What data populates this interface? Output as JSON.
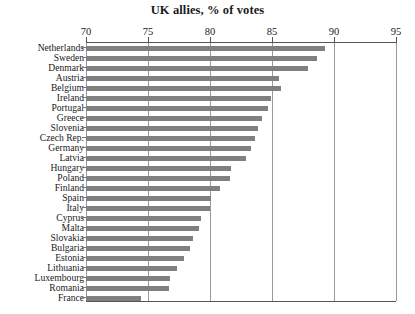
{
  "chart_data": {
    "type": "bar",
    "orientation": "horizontal",
    "title": "UK allies, % of votes",
    "xlabel": "",
    "ylabel": "",
    "xlim": [
      70,
      95
    ],
    "xticks": [
      70,
      75,
      80,
      85,
      90,
      95
    ],
    "xtick_labels": [
      "70",
      "75",
      "80",
      "85",
      "90",
      "95"
    ],
    "grid": true,
    "legend": "none",
    "bar_color": "#808080",
    "categories": [
      "Netherlands",
      "Sweden",
      "Denmark",
      "Austria",
      "Belgium",
      "Ireland",
      "Portugal",
      "Greece",
      "Slovenia",
      "Czech Rep.",
      "Germany",
      "Latvia",
      "Hungary",
      "Poland",
      "Finland",
      "Spain",
      "Italy",
      "Cyprus",
      "Malta",
      "Slovakia",
      "Bulgaria",
      "Estonia",
      "Lithuania",
      "Luxembourg",
      "Romania",
      "France"
    ],
    "values": [
      89.3,
      88.6,
      87.9,
      85.6,
      85.7,
      84.9,
      84.7,
      84.2,
      83.9,
      83.6,
      83.3,
      82.9,
      81.7,
      81.6,
      80.8,
      80.1,
      80.0,
      79.3,
      79.1,
      78.6,
      78.4,
      77.9,
      77.3,
      76.8,
      76.7,
      74.4
    ]
  }
}
